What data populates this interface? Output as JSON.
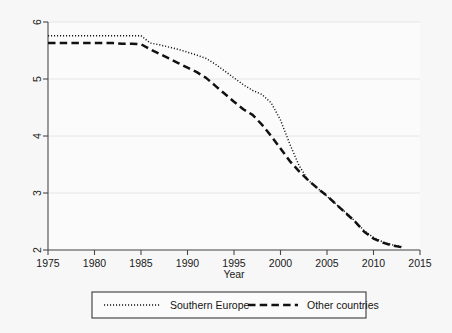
{
  "chart_data": {
    "type": "line",
    "title": "",
    "subtitle": "",
    "xlabel": "Year",
    "ylabel": "",
    "xlim": [
      1975,
      2015
    ],
    "ylim": [
      2,
      6
    ],
    "xticks": [
      1975,
      1980,
      1985,
      1990,
      1995,
      2000,
      2005,
      2010,
      2015
    ],
    "yticks": [
      2,
      3,
      4,
      5,
      6
    ],
    "grid": "horizontal",
    "legend_position": "bottom",
    "x": [
      1975,
      1976,
      1977,
      1978,
      1979,
      1980,
      1981,
      1982,
      1983,
      1984,
      1985,
      1986,
      1987,
      1988,
      1989,
      1990,
      1991,
      1992,
      1993,
      1994,
      1995,
      1996,
      1997,
      1998,
      1999,
      2000,
      2001,
      2002,
      2003,
      2004,
      2005,
      2006,
      2007,
      2008,
      2009,
      2010,
      2011,
      2012,
      2013
    ],
    "series": [
      {
        "name": "Southern Europe",
        "style": "dotted",
        "color": "#111111",
        "values": [
          5.76,
          5.76,
          5.76,
          5.76,
          5.76,
          5.76,
          5.76,
          5.76,
          5.76,
          5.76,
          5.76,
          5.63,
          5.6,
          5.56,
          5.52,
          5.47,
          5.42,
          5.36,
          5.26,
          5.14,
          5.02,
          4.9,
          4.8,
          4.73,
          4.58,
          4.28,
          3.86,
          3.48,
          3.22,
          3.08,
          2.94,
          2.8,
          2.66,
          2.51,
          2.34,
          2.22,
          2.14,
          2.09,
          2.06
        ],
        "endpoints": {
          "1975": 5.76,
          "1985": 5.76,
          "1990": 5.47,
          "1995": 5.02,
          "2000": 4.28,
          "2005": 2.94,
          "2010": 2.22,
          "2013": 2.06
        }
      },
      {
        "name": "Other countries",
        "style": "dashed",
        "color": "#111111",
        "values": [
          5.63,
          5.63,
          5.63,
          5.63,
          5.63,
          5.63,
          5.63,
          5.63,
          5.62,
          5.62,
          5.61,
          5.52,
          5.44,
          5.36,
          5.28,
          5.2,
          5.12,
          5.02,
          4.88,
          4.74,
          4.6,
          4.47,
          4.37,
          4.2,
          4.0,
          3.78,
          3.56,
          3.38,
          3.22,
          3.08,
          2.95,
          2.8,
          2.65,
          2.5,
          2.32,
          2.2,
          2.13,
          2.08,
          2.05
        ],
        "endpoints": {
          "1975": 5.63,
          "1985": 5.61,
          "1990": 5.2,
          "1995": 4.6,
          "2000": 3.78,
          "2005": 2.95,
          "2010": 2.2,
          "2013": 2.05
        }
      }
    ]
  },
  "axes": {
    "x_title": "Year",
    "x_tick_labels": [
      "1975",
      "1980",
      "1985",
      "1990",
      "1995",
      "2000",
      "2005",
      "2010",
      "2015"
    ],
    "y_tick_labels": [
      "2",
      "3",
      "4",
      "5",
      "6"
    ]
  },
  "legend": {
    "entries": [
      {
        "label": "Southern Europe",
        "style": "dotted"
      },
      {
        "label": "Other countries",
        "style": "dashed"
      }
    ]
  },
  "colors": {
    "background": "#f7f7f7",
    "plot_background": "#fbfbfb",
    "line": "#111111",
    "grid": "#e2e2e2",
    "axis": "#4a4a4a"
  }
}
